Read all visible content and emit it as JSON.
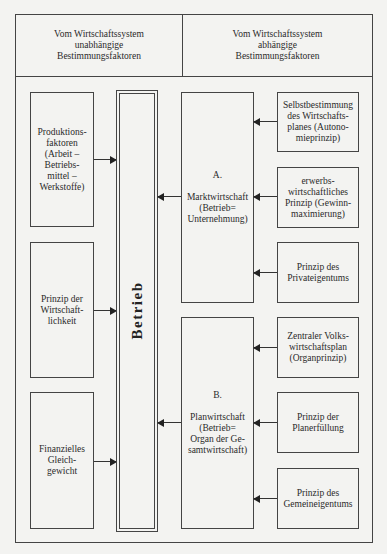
{
  "header": {
    "left": "Vom Wirtschaftssystem\nunabhängige\nBestimmungsfaktoren",
    "right": "Vom Wirtschaftssystem\nabhängige\nBestimmungsfaktoren"
  },
  "center": {
    "label": "Betrieb"
  },
  "left_factors": [
    {
      "label": "Produktions-\nfaktoren\n(Arbeit –\nBetriebs-\nmittel –\nWerkstoffe)"
    },
    {
      "label": "Prinzip der\nWirtschaft-\nlichkeit"
    },
    {
      "label": "Finanzielles\nGleich-\ngewicht"
    }
  ],
  "systems": [
    {
      "label": "A.\n\nMarktwirtschaft\n(Betrieb=\nUnternehmung)"
    },
    {
      "label": "B.\n\nPlanwirtschaft\n(Betrieb=\nOrgan der Ge-\nsamtwirtschaft)"
    }
  ],
  "right_factors": [
    {
      "label": "Selbstbestimmung\ndes Wirtschafts-\nplanes (Autono-\nmieprinzip)"
    },
    {
      "label": "erwerbs-\nwirtschaftliches\nPrinzip (Gewinn-\nmaximierung)"
    },
    {
      "label": "Prinzip des\nPrivateigentums"
    },
    {
      "label": "Zentraler Volks-\nwirtschaftsplan\n(Organprinzip)"
    },
    {
      "label": "Prinzip der\nPlanerfüllung"
    },
    {
      "label": "Prinzip des\nGemeineigentums"
    }
  ]
}
